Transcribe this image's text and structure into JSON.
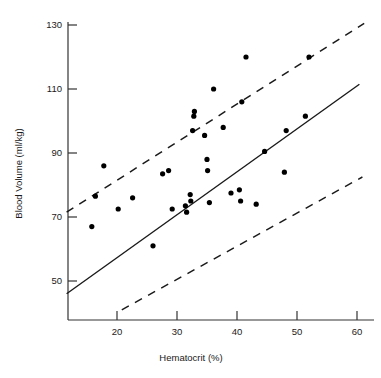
{
  "chart_data": {
    "type": "scatter",
    "title": "",
    "xlabel": "Hematocrit (%)",
    "ylabel": "Blood Volume (ml/kg)",
    "xlim": [
      11.6,
      62.0
    ],
    "ylim": [
      41.0,
      133.0
    ],
    "xticks": [
      20,
      30,
      40,
      50,
      60
    ],
    "yticks": [
      50,
      70,
      90,
      110,
      130
    ],
    "xtick_labels": [
      "20",
      "30",
      "40",
      "50",
      "60"
    ],
    "ytick_labels": [
      "50",
      "70",
      "90",
      "110",
      "130"
    ],
    "grid": false,
    "legend": null,
    "point_color": "#000000",
    "line_color": "#1a1a1a",
    "points": [
      {
        "x": 15.8,
        "y": 67.0
      },
      {
        "x": 16.4,
        "y": 76.5
      },
      {
        "x": 17.8,
        "y": 86.0
      },
      {
        "x": 20.2,
        "y": 72.5
      },
      {
        "x": 22.6,
        "y": 76.0
      },
      {
        "x": 26.0,
        "y": 61.0
      },
      {
        "x": 27.6,
        "y": 83.5
      },
      {
        "x": 28.6,
        "y": 84.5
      },
      {
        "x": 29.2,
        "y": 72.5
      },
      {
        "x": 31.4,
        "y": 73.5
      },
      {
        "x": 31.6,
        "y": 71.5
      },
      {
        "x": 32.2,
        "y": 77.0
      },
      {
        "x": 32.3,
        "y": 75.0
      },
      {
        "x": 32.6,
        "y": 97.0
      },
      {
        "x": 32.8,
        "y": 101.5
      },
      {
        "x": 32.9,
        "y": 103.0
      },
      {
        "x": 34.6,
        "y": 95.5
      },
      {
        "x": 35.0,
        "y": 88.0
      },
      {
        "x": 35.1,
        "y": 84.5
      },
      {
        "x": 35.4,
        "y": 74.5
      },
      {
        "x": 36.1,
        "y": 110.0
      },
      {
        "x": 37.7,
        "y": 98.0
      },
      {
        "x": 39.0,
        "y": 77.5
      },
      {
        "x": 40.4,
        "y": 78.5
      },
      {
        "x": 40.6,
        "y": 75.0
      },
      {
        "x": 40.8,
        "y": 106.0
      },
      {
        "x": 41.5,
        "y": 120.0
      },
      {
        "x": 43.2,
        "y": 74.0
      },
      {
        "x": 44.6,
        "y": 90.5
      },
      {
        "x": 47.9,
        "y": 84.0
      },
      {
        "x": 48.2,
        "y": 97.0
      },
      {
        "x": 51.4,
        "y": 101.5
      },
      {
        "x": 52.0,
        "y": 120.0
      }
    ],
    "lines": [
      {
        "name": "regression-line",
        "style": "solid",
        "x0": 11.6,
        "y0": 46.0,
        "x1": 60.4,
        "y1": 111.5
      },
      {
        "name": "upper-limit-line",
        "style": "dashed",
        "x0": 11.6,
        "y0": 71.5,
        "x1": 61.2,
        "y1": 130.5
      },
      {
        "name": "lower-limit-line",
        "style": "dashed",
        "x0": 20.8,
        "y0": 41.0,
        "x1": 60.9,
        "y1": 82.5
      }
    ]
  }
}
